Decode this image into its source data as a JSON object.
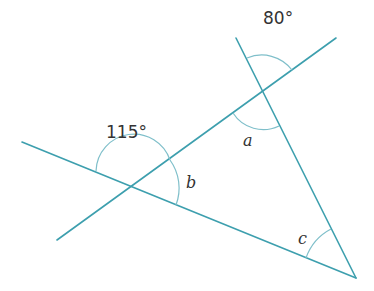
{
  "diagram": {
    "labels": {
      "top_angle": "80°",
      "left_angle": "115°",
      "a": "a",
      "b": "b",
      "c": "c"
    },
    "colors": {
      "line": "#3d9fae",
      "arc": "#7fbfca",
      "text": "#333333"
    }
  }
}
